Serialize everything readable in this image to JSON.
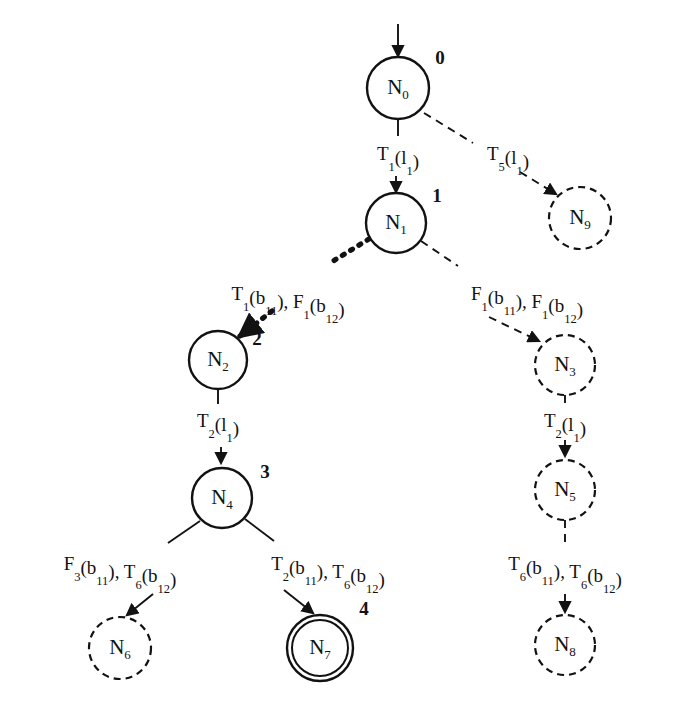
{
  "diagram": {
    "type": "state-transition-tree",
    "title": "",
    "nodes": [
      {
        "id": "N0",
        "label": "N",
        "sublabel": "0",
        "index": "0",
        "style": "solid",
        "cx": 398,
        "cy": 88,
        "r": 31,
        "index_x": 440,
        "index_y": 64
      },
      {
        "id": "N1",
        "label": "N",
        "sublabel": "1",
        "index": "1",
        "style": "solid",
        "cx": 396,
        "cy": 223,
        "r": 30,
        "index_x": 437,
        "index_y": 202
      },
      {
        "id": "N2",
        "label": "N",
        "sublabel": "2",
        "index": "2",
        "style": "solid",
        "cx": 218,
        "cy": 360,
        "r": 29,
        "index_x": 257,
        "index_y": 345
      },
      {
        "id": "N4",
        "label": "N",
        "sublabel": "4",
        "index": "3",
        "style": "solid",
        "cx": 222,
        "cy": 498,
        "r": 30,
        "index_x": 265,
        "index_y": 478
      },
      {
        "id": "N6",
        "label": "N",
        "sublabel": "6",
        "index": "",
        "style": "dashed",
        "cx": 120,
        "cy": 648,
        "r": 31,
        "index_x": 0,
        "index_y": 0
      },
      {
        "id": "N7",
        "label": "N",
        "sublabel": "7",
        "index": "4",
        "style": "accept",
        "cx": 320,
        "cy": 648,
        "r": 33,
        "index_x": 364,
        "index_y": 615
      },
      {
        "id": "N9",
        "label": "N",
        "sublabel": "9",
        "index": "",
        "style": "dashed",
        "cx": 580,
        "cy": 218,
        "r": 31,
        "index_x": 0,
        "index_y": 0
      },
      {
        "id": "N3",
        "label": "N",
        "sublabel": "3",
        "index": "",
        "style": "dashed",
        "cx": 565,
        "cy": 365,
        "r": 30,
        "index_x": 0,
        "index_y": 0
      },
      {
        "id": "N5",
        "label": "N",
        "sublabel": "5",
        "index": "",
        "style": "dashed",
        "cx": 565,
        "cy": 490,
        "r": 30,
        "index_x": 0,
        "index_y": 0
      },
      {
        "id": "N8",
        "label": "N",
        "sublabel": "8",
        "index": "",
        "style": "dashed",
        "cx": 565,
        "cy": 645,
        "r": 30,
        "index_x": 0,
        "index_y": 0
      }
    ],
    "entry_arrow": {
      "x": 398,
      "y_from": 24,
      "y_to": 56
    },
    "edges": [
      {
        "id": "e-n0-n1",
        "from": "N0",
        "to": "N1",
        "style": "solid",
        "label_parts": [
          {
            "t": "T",
            "sub": false
          },
          {
            "t": "1",
            "sub": true
          },
          {
            "t": "(l",
            "sub": false
          },
          {
            "t": "1",
            "sub": true
          },
          {
            "t": ")",
            "sub": false
          }
        ],
        "label_text": "T1(l1)",
        "label_x": 398,
        "label_y": 160,
        "path": "M 398 120 L 398 136",
        "arrow": "M 396 176 L 396 192"
      },
      {
        "id": "e-n0-n9",
        "from": "N0",
        "to": "N9",
        "style": "dashed",
        "label_parts": [
          {
            "t": "T",
            "sub": false
          },
          {
            "t": "5",
            "sub": true
          },
          {
            "t": "(l",
            "sub": false
          },
          {
            "t": "1",
            "sub": true
          },
          {
            "t": ")",
            "sub": false
          }
        ],
        "label_text": "T5(l1)",
        "label_x": 508,
        "label_y": 160,
        "path": "M 424 113 L 473 143",
        "arrow": "M 520 172 L 556 194"
      },
      {
        "id": "e-n1-n2",
        "from": "N1",
        "to": "N2",
        "style": "thickdotted",
        "label_parts": [
          {
            "t": "T",
            "sub": false
          },
          {
            "t": "1",
            "sub": true
          },
          {
            "t": "(b",
            "sub": false
          },
          {
            "t": "11",
            "sub": true
          },
          {
            "t": "), F",
            "sub": false
          },
          {
            "t": "1",
            "sub": true
          },
          {
            "t": "(b",
            "sub": false
          },
          {
            "t": "12",
            "sub": true
          },
          {
            "t": ")",
            "sub": false
          }
        ],
        "label_text": "T1(b11), F1(b12)",
        "label_x": 288,
        "label_y": 300,
        "path": "M 369 239 L 330 263",
        "arrow": "M 272 311 L 240 336"
      },
      {
        "id": "e-n1-n3",
        "from": "N1",
        "to": "N3",
        "style": "dashed",
        "label_parts": [
          {
            "t": "F",
            "sub": false
          },
          {
            "t": "1",
            "sub": true
          },
          {
            "t": "(b",
            "sub": false
          },
          {
            "t": "11",
            "sub": true
          },
          {
            "t": "), F",
            "sub": false
          },
          {
            "t": "1",
            "sub": true
          },
          {
            "t": "(b",
            "sub": false
          },
          {
            "t": "12",
            "sub": true
          },
          {
            "t": ")",
            "sub": false
          }
        ],
        "label_text": "F1(b11), F1(b12)",
        "label_x": 527,
        "label_y": 300,
        "path": "M 421 241 L 458 266",
        "arrow": "M 489 317 L 539 341"
      },
      {
        "id": "e-n2-n4",
        "from": "N2",
        "to": "N4",
        "style": "solid",
        "label_parts": [
          {
            "t": "T",
            "sub": false
          },
          {
            "t": "2",
            "sub": true
          },
          {
            "t": "(l",
            "sub": false
          },
          {
            "t": "1",
            "sub": true
          },
          {
            "t": ")",
            "sub": false
          }
        ],
        "label_text": "T2(l1)",
        "label_x": 218,
        "label_y": 427,
        "path": "M 218 389 L 218 404",
        "arrow": "M 221 447 L 221 463"
      },
      {
        "id": "e-n3-n5",
        "from": "N3",
        "to": "N5",
        "style": "dashed",
        "label_parts": [
          {
            "t": "T",
            "sub": false
          },
          {
            "t": "2",
            "sub": true
          },
          {
            "t": "(l",
            "sub": false
          },
          {
            "t": "1",
            "sub": true
          },
          {
            "t": ")",
            "sub": false
          }
        ],
        "label_text": "T2(l1)",
        "label_x": 565,
        "label_y": 427,
        "path": "M 565 395 L 565 405",
        "arrow": "M 565 440 L 565 456"
      },
      {
        "id": "e-n4-n6",
        "from": "N4",
        "to": "N6",
        "style": "solid",
        "label_parts": [
          {
            "t": "F",
            "sub": false
          },
          {
            "t": "3",
            "sub": true
          },
          {
            "t": "(b",
            "sub": false
          },
          {
            "t": "11",
            "sub": true
          },
          {
            "t": "), T",
            "sub": false
          },
          {
            "t": "6",
            "sub": true
          },
          {
            "t": "(b",
            "sub": false
          },
          {
            "t": "12",
            "sub": true
          },
          {
            "t": ")",
            "sub": false
          }
        ],
        "label_text": "F3(b11), T6(b12)",
        "label_x": 120,
        "label_y": 570,
        "path": "M 200 521 L 168 543",
        "arrow": "M 153 594 L 127 615"
      },
      {
        "id": "e-n4-n7",
        "from": "N4",
        "to": "N7",
        "style": "solid",
        "label_parts": [
          {
            "t": "T",
            "sub": false
          },
          {
            "t": "2",
            "sub": true
          },
          {
            "t": "(b",
            "sub": false
          },
          {
            "t": "11",
            "sub": true
          },
          {
            "t": "), T",
            "sub": false
          },
          {
            "t": "6",
            "sub": true
          },
          {
            "t": "(b",
            "sub": false
          },
          {
            "t": "12",
            "sub": true
          },
          {
            "t": ")",
            "sub": false
          }
        ],
        "label_text": "T2(b11), T6(b12)",
        "label_x": 328,
        "label_y": 570,
        "path": "M 245 519 L 274 541",
        "arrow": "M 284 590 L 313 613"
      },
      {
        "id": "e-n5-n8",
        "from": "N5",
        "to": "N8",
        "style": "dashed",
        "label_parts": [
          {
            "t": "T",
            "sub": false
          },
          {
            "t": "6",
            "sub": true
          },
          {
            "t": "(b",
            "sub": false
          },
          {
            "t": "11",
            "sub": true
          },
          {
            "t": "), T",
            "sub": false
          },
          {
            "t": "6",
            "sub": true
          },
          {
            "t": "(b",
            "sub": false
          },
          {
            "t": "12",
            "sub": true
          },
          {
            "t": ")",
            "sub": false
          }
        ],
        "label_text": "T6(b11), T6(b12)",
        "label_x": 565,
        "label_y": 570,
        "path": "M 565 520 L 565 543",
        "arrow": "M 565 594 L 565 612"
      }
    ]
  }
}
